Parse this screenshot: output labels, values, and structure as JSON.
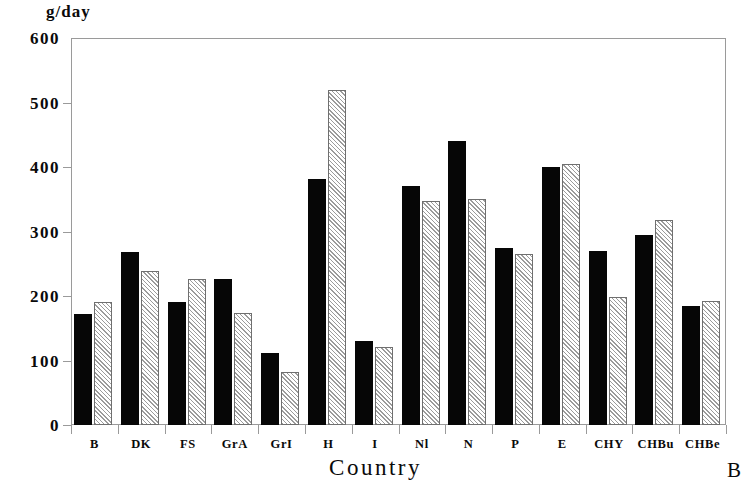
{
  "figure": {
    "panel_label": "B",
    "y_unit_label": "g/day",
    "x_axis_title": "Country"
  },
  "chart_data": {
    "type": "bar",
    "title": "",
    "subtitle": "",
    "xlabel": "Country",
    "ylabel": "g/day",
    "ylim": [
      0,
      600
    ],
    "yticks": [
      0,
      100,
      200,
      300,
      400,
      500,
      600
    ],
    "ytick_labels": [
      "0",
      "100",
      "200",
      "300",
      "400",
      "500",
      "600"
    ],
    "grid": false,
    "legend": "none",
    "categories": [
      "B",
      "DK",
      "FS",
      "GrA",
      "GrI",
      "H",
      "I",
      "Nl",
      "N",
      "P",
      "E",
      "CHY",
      "CHBu",
      "CHBe"
    ],
    "series": [
      {
        "name": "series-1-solid-black",
        "style": "solid-black",
        "color": "#060606",
        "values": [
          172,
          268,
          191,
          226,
          112,
          382,
          131,
          370,
          441,
          274,
          400,
          270,
          294,
          184
        ]
      },
      {
        "name": "series-2-hatched-grey",
        "style": "hatched-grey",
        "color": "#9b9b9b",
        "values": [
          190,
          239,
          226,
          174,
          82,
          519,
          121,
          348,
          350,
          265,
          405,
          198,
          318,
          193
        ]
      }
    ]
  }
}
